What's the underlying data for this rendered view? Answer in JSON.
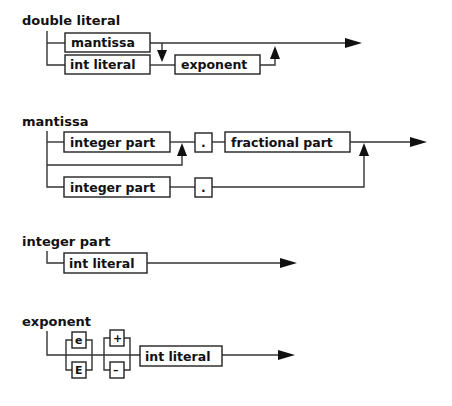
{
  "diagrams": {
    "double_literal": {
      "title": "double literal",
      "nodes": {
        "mantissa": "mantissa",
        "int_literal": "int literal",
        "exponent": "exponent"
      }
    },
    "mantissa": {
      "title": "mantissa",
      "nodes": {
        "integer_part_1": "integer part",
        "dot_1": ".",
        "fractional_part": "fractional part",
        "integer_part_2": "integer part",
        "dot_2": "."
      }
    },
    "integer_part": {
      "title": "integer part",
      "nodes": {
        "int_literal": "int literal"
      }
    },
    "exponent": {
      "title": "exponent",
      "nodes": {
        "e_lower": "e",
        "e_upper": "E",
        "plus": "+",
        "minus": "–",
        "int_literal": "int literal"
      }
    }
  }
}
